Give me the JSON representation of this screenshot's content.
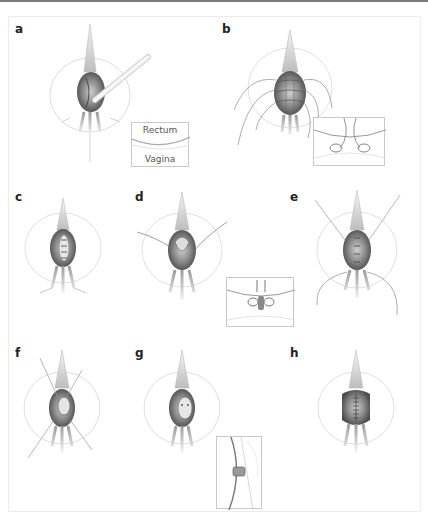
{
  "figure": {
    "panels": [
      {
        "id": "a",
        "label": "a",
        "description": "Incision of the posterior vaginal wall with retractor"
      },
      {
        "id": "b",
        "label": "b",
        "description": "Multiple traction sutures placed around the defect"
      },
      {
        "id": "c",
        "label": "c",
        "description": "Exposed defect"
      },
      {
        "id": "d",
        "label": "d",
        "description": "Sutures placed through the defect edges"
      },
      {
        "id": "e",
        "label": "e",
        "description": "Additional sutures with long threads"
      },
      {
        "id": "f",
        "label": "f",
        "description": "Crossed sutures tied"
      },
      {
        "id": "g",
        "label": "g",
        "description": "Closure of inner layer"
      },
      {
        "id": "h",
        "label": "h",
        "description": "Final closure of vaginal wall with running suture"
      }
    ],
    "insets": {
      "a": {
        "top_label": "Rectum",
        "bottom_label": "Vagina"
      }
    }
  },
  "colors": {
    "ink": "#222222",
    "sketch": "#8a8a8a",
    "shade_dark": "#5a5a5a",
    "shade_mid": "#9c9c9c",
    "frame": "#ececec",
    "rule": "#7a7a7a"
  }
}
